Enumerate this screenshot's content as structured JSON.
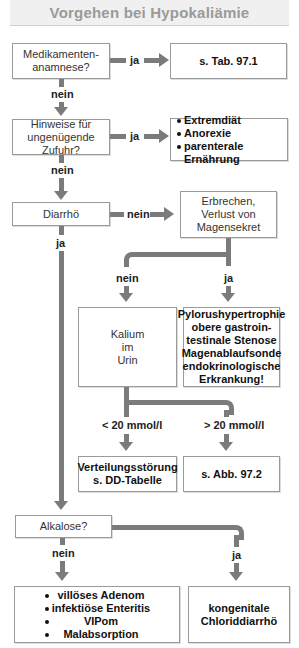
{
  "title": "Vorgehen bei Hypokaliämie",
  "nodes": {
    "medikamente": "Medikamenten-\nanamnese?",
    "tab97": "s. Tab. 97.1",
    "zufuhr": "Hinweise für\nungenügende Zufuhr?",
    "zufuhr_causes": [
      "Extremdiät",
      "Anorexie",
      "parenterale Ernährung"
    ],
    "diarrhoe": "Diarrhö",
    "erbrechen": "Erbrechen,\nVerlust von\nMagensekret",
    "kalium": "Kalium\nim\nUrin",
    "pylorus": "Pylorushypertrophie\nobere gastroin-\ntestinale Stenose\nMagenablaufsonde\nendokrinologische\nErkrankung!",
    "verteilung": "Verteilungsstörung\ns. DD-Tabelle",
    "abb972": "s. Abb. 97.2",
    "alkalose": "Alkalose?",
    "alkalose_nein_causes": [
      "villöses Adenom",
      "infektiöse Enteritis",
      "VIPom",
      "Malabsorption"
    ],
    "chlorid": "kongenitale\nChloriddiarrhö"
  },
  "labels": {
    "ja": "ja",
    "nein": "nein",
    "lt20": "< 20 mmol/l",
    "gt20": "> 20 mmol/l"
  },
  "colors": {
    "connector": "#7b7b7b",
    "box_border": "#9a9a9a",
    "title_text": "#9a9a9a",
    "title_bg": "#f0f0f0"
  }
}
